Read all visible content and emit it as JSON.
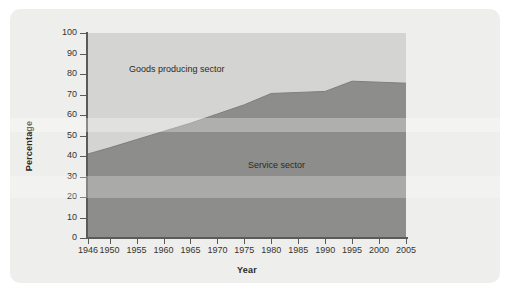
{
  "figure": {
    "panel_background": "#eeeeec",
    "page_background": "#ffffff"
  },
  "chart_data": {
    "type": "area",
    "title": "",
    "subtitle": "",
    "xlabel": "Year",
    "ylabel": "Percentage",
    "stacked": true,
    "grid": false,
    "legend_position": "in-plot annotations",
    "xlim": [
      1946,
      2005
    ],
    "ylim": [
      0,
      100
    ],
    "x": [
      1946,
      1950,
      1955,
      1960,
      1965,
      1970,
      1975,
      1980,
      1985,
      1990,
      1995,
      2000,
      2005
    ],
    "categories": [
      "1946",
      "1950",
      "1955",
      "1960",
      "1965",
      "1970",
      "1975",
      "1980",
      "1985",
      "1990",
      "1995",
      "2000",
      "2005"
    ],
    "xticks": [
      1946,
      1950,
      1955,
      1960,
      1965,
      1970,
      1975,
      1980,
      1985,
      1990,
      1995,
      2000,
      2005
    ],
    "xtick_labels": [
      "1946",
      "1950",
      "1955",
      "1960",
      "1965",
      "1970",
      "1975",
      "1980",
      "1985",
      "1990",
      "1995",
      "2000",
      "2005"
    ],
    "yticks": [
      0,
      10,
      20,
      30,
      40,
      50,
      60,
      70,
      80,
      90,
      100
    ],
    "ytick_labels": [
      "0",
      "10",
      "20",
      "30",
      "40",
      "50",
      "60",
      "70",
      "80",
      "90",
      "100"
    ],
    "series": [
      {
        "name": "Service sector",
        "color": "#8d8d8b",
        "values": [
          41,
          44,
          48,
          52,
          56,
          60.5,
          65,
          70.5,
          71,
          71.5,
          76.5,
          76,
          75.5
        ]
      },
      {
        "name": "Goods producing sector",
        "color": "#d4d4d2",
        "values": [
          59,
          56,
          52,
          48,
          44,
          39.5,
          35,
          29.5,
          29,
          28.5,
          23.5,
          24,
          24.5
        ]
      }
    ],
    "annotations": [
      {
        "text": "Goods producing sector",
        "x": 1956,
        "y": 83
      },
      {
        "text": "Service sector",
        "x": 1978,
        "y": 36
      }
    ]
  },
  "axes": {
    "y_title": "Percentage",
    "x_title": "Year",
    "y_tick_labels": [
      "100",
      "90",
      "80",
      "70",
      "60",
      "50",
      "40",
      "30",
      "20",
      "10",
      "0"
    ],
    "x_tick_labels": [
      "1946",
      "1950",
      "1955",
      "1960",
      "1965",
      "1970",
      "1975",
      "1980",
      "1985",
      "1990",
      "1995",
      "2000",
      "2005"
    ]
  },
  "annotations": {
    "goods": "Goods producing sector",
    "service": "Service sector"
  },
  "colors": {
    "goods_sector": "#d4d4d2",
    "service_sector": "#8d8d8b",
    "axis": "#5a5a58",
    "text": "#35352f",
    "panel": "#eeeeec"
  }
}
